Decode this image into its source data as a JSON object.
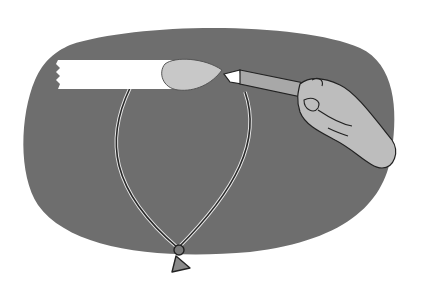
{
  "illustration": {
    "description": "Grayscale illustration: a hand holding a glue brush, applying glue to a strip of tape stuck on top of a balloon outline, drawn over a dark gray rounded oval background.",
    "colors": {
      "background": "#ffffff",
      "oval": "#6e6e6e",
      "balloon_outline": "#2a2a2a",
      "balloon_highlight": "#e8e8e8",
      "tape": "#ffffff",
      "glue_blob": "#c8c8c8",
      "brush_handle": "#a8a8a8",
      "hand": "#bdbdbd",
      "line": "#222222"
    },
    "elements": [
      "oval-background",
      "tape-strip",
      "glue-blob",
      "brush",
      "hand",
      "balloon-outline",
      "balloon-knot"
    ]
  }
}
